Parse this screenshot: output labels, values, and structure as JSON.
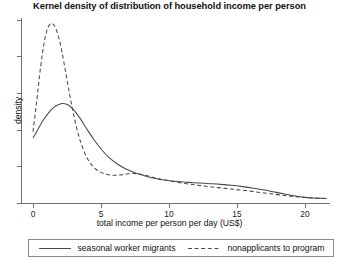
{
  "chart_data": {
    "type": "line",
    "title": "Kernel density of distribution of household income per person",
    "xlabel": "total income per person per day (US$)",
    "ylabel": "density",
    "xlim": [
      0,
      21.8
    ],
    "ylim": [
      0,
      0.2275
    ],
    "grid": false,
    "legend_position": "bottom",
    "xticks": [
      0,
      5,
      10,
      15,
      20
    ],
    "xticklabels": [
      "0",
      "5",
      "10",
      "15",
      "20"
    ],
    "yticks": [
      0,
      0.0455,
      0.091,
      0.1365,
      0.182,
      0.2275
    ],
    "yticklabels": [
      "",
      "",
      "",
      "",
      "",
      ""
    ],
    "series": [
      {
        "name": "seasonal worker migrants",
        "style": "solid",
        "color": "#4a4a4a",
        "x": [
          0,
          0.3,
          0.7,
          1.1,
          1.5,
          1.9,
          2.2,
          2.6,
          3.0,
          3.5,
          4.0,
          4.5,
          5.0,
          5.6,
          6.2,
          6.8,
          7.5,
          8.2,
          9.0,
          9.8,
          10.6,
          11.4,
          12.2,
          13.0,
          13.8,
          14.6,
          15.4,
          16.2,
          17.0,
          17.8,
          18.6,
          19.3,
          20.0,
          20.6,
          21.1,
          21.6
        ],
        "y": [
          0.0811,
          0.0898,
          0.1019,
          0.1114,
          0.1188,
          0.1228,
          0.1239,
          0.1222,
          0.116,
          0.1046,
          0.0913,
          0.0788,
          0.0676,
          0.0568,
          0.0489,
          0.0432,
          0.0381,
          0.0345,
          0.0311,
          0.0288,
          0.0272,
          0.0262,
          0.0254,
          0.0246,
          0.0237,
          0.0225,
          0.0209,
          0.019,
          0.0167,
          0.0141,
          0.0114,
          0.0092,
          0.0076,
          0.0068,
          0.0064,
          0.0062
        ]
      },
      {
        "name": "nonapplicants to program",
        "style": "dashed",
        "color": "#4a4a4a",
        "x": [
          0,
          0.25,
          0.55,
          0.85,
          1.1,
          1.35,
          1.6,
          1.85,
          2.1,
          2.4,
          2.7,
          3.0,
          3.4,
          3.8,
          4.2,
          4.6,
          5.0,
          5.4,
          5.8,
          6.2,
          6.6,
          7.0,
          7.4,
          7.8,
          8.3,
          8.8,
          9.4,
          10.0,
          10.8,
          11.6,
          12.4,
          13.2,
          14.0,
          14.8,
          15.6,
          16.4,
          17.2,
          18.0,
          18.8,
          19.5,
          20.2,
          20.8,
          21.3,
          21.6
        ],
        "y": [
          0.089,
          0.1236,
          0.1682,
          0.2022,
          0.2181,
          0.2232,
          0.2198,
          0.2084,
          0.1905,
          0.163,
          0.1348,
          0.109,
          0.0818,
          0.0628,
          0.0503,
          0.0428,
          0.0386,
          0.0363,
          0.0352,
          0.0351,
          0.0358,
          0.0368,
          0.0372,
          0.0366,
          0.0348,
          0.0326,
          0.0302,
          0.0282,
          0.0258,
          0.0238,
          0.0221,
          0.0205,
          0.019,
          0.0175,
          0.016,
          0.0144,
          0.0127,
          0.011,
          0.0094,
          0.0082,
          0.0073,
          0.0067,
          0.0064,
          0.0063
        ]
      }
    ]
  },
  "legend": {
    "entries": [
      {
        "label": "seasonal worker migrants"
      },
      {
        "label": "nonapplicants to program"
      }
    ]
  }
}
